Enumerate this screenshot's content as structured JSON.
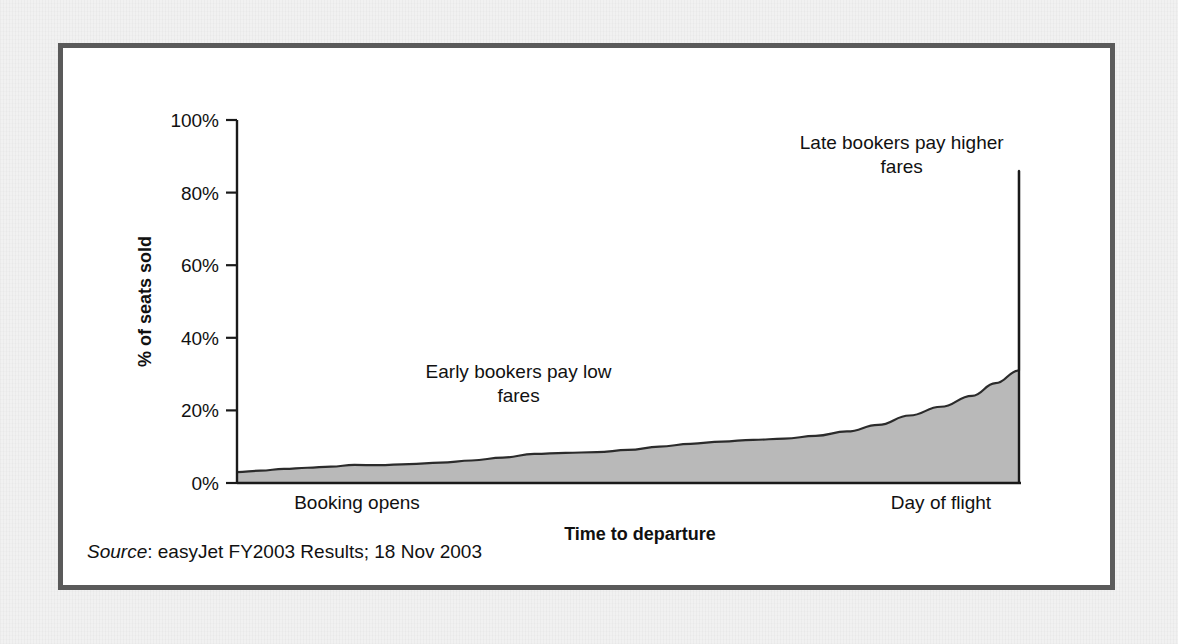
{
  "slide": {
    "source_label": "Source",
    "source_text": ": easyJet FY2003 Results; 18 Nov 2003"
  },
  "chart_data": {
    "type": "area",
    "title": "Booking profile",
    "xlabel": "Time to departure",
    "ylabel": "% of seats sold",
    "ylim": [
      0,
      100
    ],
    "ytick_labels": [
      "0%",
      "20%",
      "40%",
      "60%",
      "80%",
      "100%"
    ],
    "ytick_values": [
      0,
      20,
      40,
      60,
      80,
      100
    ],
    "grid": false,
    "legend": "none",
    "x_category_labels": [
      "Booking opens",
      "Day of flight"
    ],
    "xlim": [
      0,
      100
    ],
    "x": [
      0,
      3,
      6,
      9,
      12,
      15,
      18,
      22,
      26,
      30,
      34,
      38,
      42,
      46,
      50,
      54,
      58,
      62,
      66,
      70,
      74,
      78,
      82,
      86,
      90,
      94,
      97,
      100
    ],
    "values": [
      3.0,
      3.4,
      3.9,
      4.2,
      4.5,
      5.0,
      4.9,
      5.2,
      5.6,
      6.2,
      7.0,
      8.0,
      8.3,
      8.5,
      9.1,
      10.0,
      10.8,
      11.4,
      11.9,
      12.2,
      13.0,
      14.2,
      16.0,
      18.6,
      21.0,
      24.0,
      27.5,
      31.0
    ],
    "series_name": "% of seats sold",
    "annotations": [
      {
        "id": "early-bookers",
        "lines": [
          "Early bookers pay low",
          "fares"
        ],
        "x_pct": 36,
        "y_pct": 29
      },
      {
        "id": "late-bookers",
        "lines": [
          "Late bookers pay higher",
          "fares"
        ],
        "x_pct": 85,
        "y_pct": 92
      }
    ],
    "colors": {
      "area_fill": "#b9b9b9",
      "line": "#2b2b2b",
      "axis": "#1a1a1a",
      "frame": "#5a5a5a",
      "plot_background": "#ffffff"
    },
    "peak_value": 86,
    "start_value": 3
  }
}
